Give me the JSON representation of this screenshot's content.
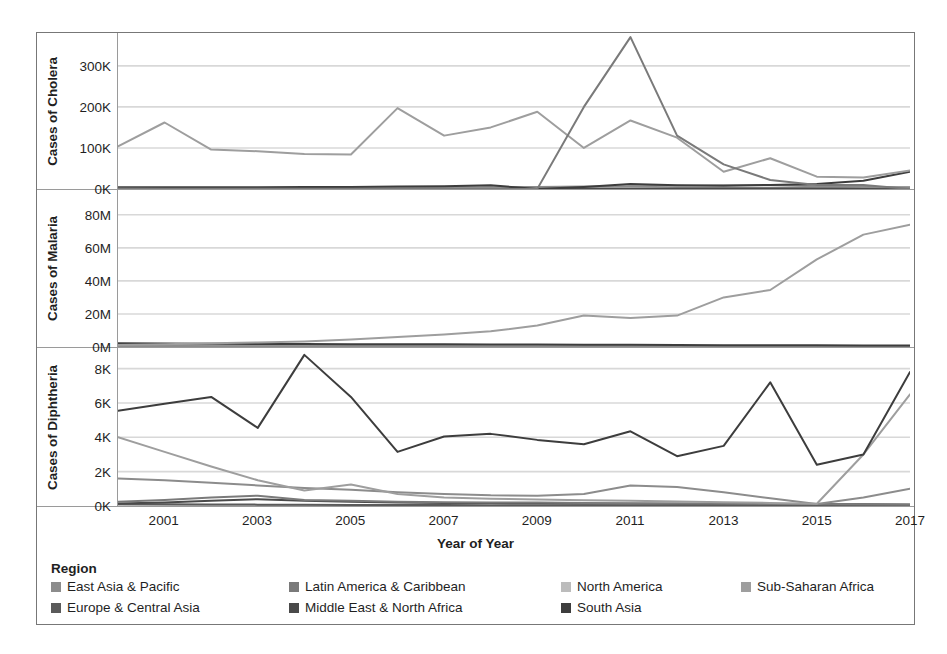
{
  "legend": {
    "title": "Region",
    "items": [
      {
        "label": "East Asia & Pacific",
        "color": "#8c8c8c",
        "col": 0,
        "row": 0
      },
      {
        "label": "Europe & Central Asia",
        "color": "#5a5a5a",
        "col": 0,
        "row": 1
      },
      {
        "label": "Latin America & Caribbean",
        "color": "#7a7a7a",
        "col": 1,
        "row": 0
      },
      {
        "label": "Middle East & North Africa",
        "color": "#4a4a4a",
        "col": 1,
        "row": 1
      },
      {
        "label": "North America",
        "color": "#bcbcbc",
        "col": 2,
        "row": 0
      },
      {
        "label": "South Asia",
        "color": "#3d3d3d",
        "col": 2,
        "row": 1
      },
      {
        "label": "Sub-Saharan Africa",
        "color": "#9e9e9e",
        "col": 3,
        "row": 0
      }
    ]
  },
  "xaxis": {
    "title": "Year of Year",
    "ticks": [
      "2001",
      "2003",
      "2005",
      "2007",
      "2009",
      "2011",
      "2013",
      "2015",
      "2017"
    ],
    "tick_values": [
      2001,
      2003,
      2005,
      2007,
      2009,
      2011,
      2013,
      2015,
      2017
    ],
    "range": [
      2000,
      2017
    ]
  },
  "chart_data": [
    {
      "type": "line",
      "title": "Cases of Cholera",
      "ylabel": "Cases of Cholera",
      "xlabel": "Year of Year",
      "ytick_labels": [
        "0K",
        "100K",
        "200K",
        "300K"
      ],
      "ytick_values": [
        0,
        100000,
        200000,
        300000
      ],
      "ylim": [
        0,
        380000
      ],
      "grid": true,
      "legend_position": "bottom",
      "x": [
        2000,
        2001,
        2002,
        2003,
        2004,
        2005,
        2006,
        2007,
        2008,
        2009,
        2010,
        2011,
        2012,
        2013,
        2014,
        2015,
        2016,
        2017
      ],
      "series": [
        {
          "name": "Sub-Saharan Africa",
          "color": "#9e9e9e",
          "values": [
            104000,
            162000,
            96000,
            92000,
            85000,
            84000,
            197000,
            130000,
            150000,
            188000,
            100000,
            167000,
            125000,
            42000,
            75000,
            30000,
            28000,
            45000
          ]
        },
        {
          "name": "South Asia",
          "color": "#3d3d3d",
          "values": [
            4000,
            4500,
            4000,
            4500,
            5000,
            4800,
            6000,
            7000,
            9000,
            0,
            5000,
            12000,
            9000,
            8000,
            10000,
            12000,
            20000,
            42000
          ]
        },
        {
          "name": "Latin America & Caribbean",
          "color": "#7a7a7a",
          "values": [
            1000,
            800,
            700,
            600,
            500,
            400,
            400,
            300,
            300,
            300,
            200000,
            370000,
            130000,
            60000,
            22000,
            10000,
            10000,
            0
          ]
        },
        {
          "name": "East Asia & Pacific",
          "color": "#8c8c8c",
          "values": [
            2000,
            2000,
            2000,
            2000,
            2500,
            3000,
            3500,
            4000,
            4500,
            5000,
            6000,
            7000,
            8000,
            9000,
            9000,
            7000,
            5000,
            4000
          ]
        },
        {
          "name": "Middle East & North Africa",
          "color": "#4a4a4a",
          "values": [
            500,
            500,
            600,
            600,
            700,
            700,
            800,
            900,
            1000,
            1000,
            1200,
            1500,
            1600,
            1800,
            1800,
            2000,
            2500,
            3000
          ]
        },
        {
          "name": "Europe & Central Asia",
          "color": "#5a5a5a",
          "values": [
            300,
            300,
            250,
            250,
            200,
            200,
            150,
            150,
            150,
            100,
            100,
            100,
            100,
            100,
            100,
            100,
            100,
            100
          ]
        },
        {
          "name": "North America",
          "color": "#bcbcbc",
          "values": [
            50,
            50,
            50,
            50,
            50,
            50,
            50,
            50,
            50,
            50,
            50,
            50,
            50,
            50,
            50,
            50,
            50,
            50
          ]
        }
      ]
    },
    {
      "type": "line",
      "title": "Cases of Malaria",
      "ylabel": "Cases of Malaria",
      "xlabel": "Year of Year",
      "ytick_labels": [
        "0M",
        "20M",
        "40M",
        "60M",
        "80M"
      ],
      "ytick_values": [
        0,
        20000000,
        40000000,
        60000000,
        80000000
      ],
      "ylim": [
        0,
        95000000
      ],
      "grid": true,
      "legend_position": "bottom",
      "x": [
        2000,
        2001,
        2002,
        2003,
        2004,
        2005,
        2006,
        2007,
        2008,
        2009,
        2010,
        2011,
        2012,
        2013,
        2014,
        2015,
        2016,
        2017
      ],
      "series": [
        {
          "name": "Sub-Saharan Africa",
          "color": "#9e9e9e",
          "values": [
            1200000,
            1600000,
            2200000,
            2700000,
            3300000,
            4500000,
            6000000,
            7500000,
            9500000,
            13000000,
            19000000,
            17500000,
            19000000,
            30000000,
            34500000,
            53000000,
            68000000,
            74000000
          ]
        },
        {
          "name": "South Asia",
          "color": "#3d3d3d",
          "values": [
            2200000,
            2100000,
            1900000,
            1800000,
            1800000,
            1700000,
            1700000,
            1600000,
            1500000,
            1500000,
            1400000,
            1300000,
            1200000,
            1100000,
            1100000,
            1000000,
            900000,
            900000
          ]
        },
        {
          "name": "East Asia & Pacific",
          "color": "#8c8c8c",
          "values": [
            600000,
            550000,
            500000,
            480000,
            450000,
            420000,
            400000,
            380000,
            360000,
            340000,
            320000,
            300000,
            280000,
            260000,
            250000,
            240000,
            230000,
            220000
          ]
        },
        {
          "name": "Latin America & Caribbean",
          "color": "#7a7a7a",
          "values": [
            400000,
            380000,
            350000,
            330000,
            300000,
            280000,
            260000,
            240000,
            220000,
            200000,
            180000,
            160000,
            150000,
            140000,
            130000,
            120000,
            110000,
            100000
          ]
        },
        {
          "name": "Middle East & North Africa",
          "color": "#4a4a4a",
          "values": [
            200000,
            190000,
            180000,
            170000,
            160000,
            150000,
            140000,
            130000,
            120000,
            110000,
            100000,
            95000,
            90000,
            85000,
            80000,
            75000,
            70000,
            65000
          ]
        },
        {
          "name": "Europe & Central Asia",
          "color": "#5a5a5a",
          "values": [
            30000,
            25000,
            20000,
            15000,
            12000,
            10000,
            8000,
            6000,
            5000,
            4000,
            3000,
            2000,
            1500,
            1000,
            800,
            600,
            500,
            400
          ]
        },
        {
          "name": "North America",
          "color": "#bcbcbc",
          "values": [
            2000,
            2000,
            2000,
            2000,
            2000,
            2000,
            2000,
            2000,
            2000,
            2000,
            2000,
            2000,
            2000,
            2000,
            2000,
            2000,
            2000,
            2000
          ]
        }
      ]
    },
    {
      "type": "line",
      "title": "Cases of Diphtheria",
      "ylabel": "Cases of Diphtheria",
      "xlabel": "Year of Year",
      "ytick_labels": [
        "0K",
        "2K",
        "4K",
        "6K",
        "8K"
      ],
      "ytick_values": [
        0,
        2000,
        4000,
        6000,
        8000
      ],
      "ylim": [
        0,
        9200
      ],
      "grid": true,
      "legend_position": "bottom",
      "x": [
        2000,
        2001,
        2002,
        2003,
        2004,
        2005,
        2006,
        2007,
        2008,
        2009,
        2010,
        2011,
        2012,
        2013,
        2014,
        2015,
        2016,
        2017
      ],
      "series": [
        {
          "name": "South Asia",
          "color": "#3d3d3d",
          "values": [
            5550,
            5950,
            6350,
            4550,
            8800,
            6350,
            3150,
            4050,
            4200,
            3850,
            3600,
            4350,
            2900,
            3500,
            7200,
            2400,
            3000,
            7800
          ]
        },
        {
          "name": "Sub-Saharan Africa",
          "color": "#9e9e9e",
          "values": [
            4000,
            3150,
            2300,
            1500,
            900,
            1250,
            700,
            500,
            420,
            380,
            330,
            300,
            260,
            220,
            180,
            130,
            3000,
            6500
          ]
        },
        {
          "name": "East Asia & Pacific",
          "color": "#8c8c8c",
          "values": [
            1600,
            1500,
            1350,
            1200,
            1050,
            950,
            800,
            700,
            620,
            600,
            700,
            1200,
            1100,
            800,
            450,
            120,
            500,
            1000
          ]
        },
        {
          "name": "Latin America & Caribbean",
          "color": "#7a7a7a",
          "values": [
            250,
            350,
            500,
            600,
            350,
            300,
            250,
            220,
            200,
            200,
            180,
            150,
            140,
            130,
            120,
            100,
            90,
            80
          ]
        },
        {
          "name": "Middle East & North Africa",
          "color": "#4a4a4a",
          "values": [
            150,
            200,
            300,
            400,
            300,
            250,
            200,
            180,
            170,
            160,
            150,
            140,
            130,
            120,
            110,
            100,
            95,
            90
          ]
        },
        {
          "name": "Europe & Central Asia",
          "color": "#5a5a5a",
          "values": [
            120,
            100,
            90,
            80,
            70,
            65,
            60,
            55,
            50,
            48,
            45,
            42,
            40,
            38,
            35,
            32,
            30,
            28
          ]
        },
        {
          "name": "North America",
          "color": "#bcbcbc",
          "values": [
            5,
            5,
            5,
            5,
            5,
            5,
            5,
            5,
            5,
            5,
            5,
            5,
            5,
            5,
            5,
            5,
            5,
            5
          ]
        }
      ]
    }
  ]
}
